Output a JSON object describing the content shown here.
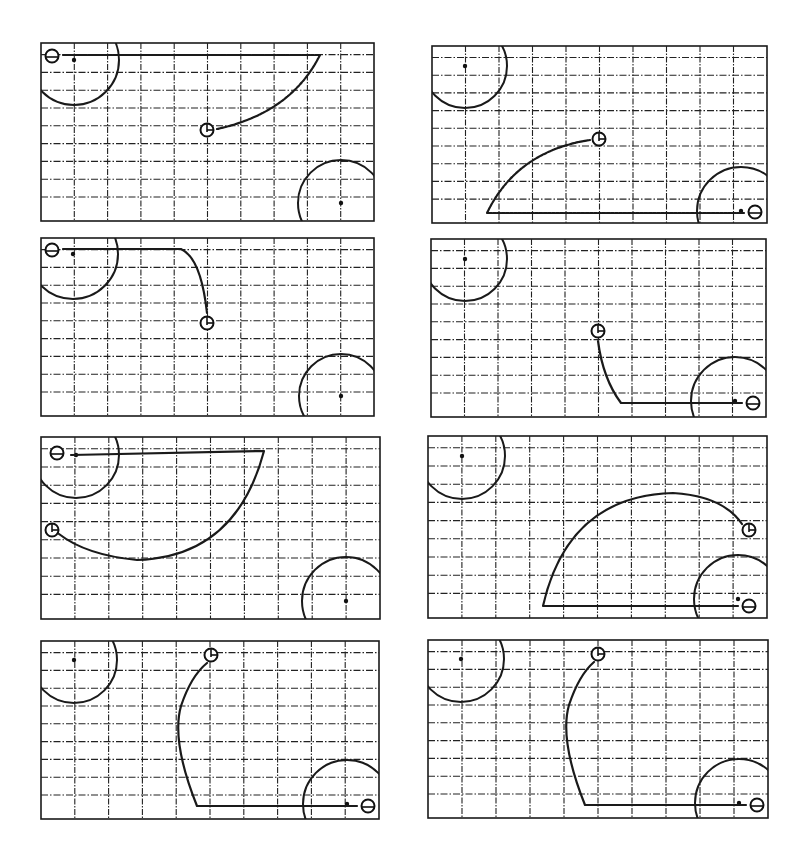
{
  "figure": {
    "layout": {
      "rows": 4,
      "cols": 2
    },
    "grid": {
      "columns": 10,
      "rows": 10
    },
    "colors": {
      "ink": "#1a1a1a",
      "background": "#ffffff"
    },
    "legend_symbols": {
      "start_marker": "circle-with-bar",
      "goal_marker": "circle-with-tick",
      "obstacle": "large-circle",
      "obstacle_center": "dot"
    }
  },
  "chart_data": {
    "type": "diagram",
    "title": "",
    "panels": [
      {
        "id": 1,
        "position": "row1-left",
        "x": 41,
        "y": 43,
        "w": 333,
        "h": 178,
        "obstacles": [
          {
            "cx": 33,
            "cy": 17,
            "r": 45
          },
          {
            "cx": 300,
            "cy": 160,
            "r": 43
          }
        ],
        "start": {
          "x": 11,
          "y": 13,
          "type": "bar"
        },
        "goal": {
          "x": 166,
          "y": 87,
          "type": "tick"
        },
        "path": "M 22 12 L 279 12 Q 250 70 176 86",
        "path_style": "solid-then-dotted"
      },
      {
        "id": 2,
        "position": "row1-right",
        "x": 432,
        "y": 46,
        "w": 335,
        "h": 177,
        "obstacles": [
          {
            "cx": 33,
            "cy": 20,
            "r": 42
          },
          {
            "cx": 309,
            "cy": 165,
            "r": 44
          }
        ],
        "start": {
          "x": 323,
          "y": 166,
          "type": "bar"
        },
        "goal": {
          "x": 167,
          "y": 93,
          "type": "tick"
        },
        "path": "M 312 167 L 55 167 Q 85 105 158 94",
        "path_style": "solid-then-dotted"
      },
      {
        "id": 3,
        "position": "row2-left",
        "x": 41,
        "y": 238,
        "w": 333,
        "h": 178,
        "obstacles": [
          {
            "cx": 32,
            "cy": 16,
            "r": 45
          },
          {
            "cx": 300,
            "cy": 158,
            "r": 42
          }
        ],
        "start": {
          "x": 11,
          "y": 12,
          "type": "bar"
        },
        "goal": {
          "x": 166,
          "y": 85,
          "type": "tick"
        },
        "path": "M 22 11 L 140 11 Q 160 20 166 75",
        "path_style": "solid"
      },
      {
        "id": 4,
        "position": "row2-right",
        "x": 431,
        "y": 239,
        "w": 335,
        "h": 178,
        "obstacles": [
          {
            "cx": 34,
            "cy": 20,
            "r": 42
          },
          {
            "cx": 304,
            "cy": 162,
            "r": 44
          }
        ],
        "start": {
          "x": 322,
          "y": 164,
          "type": "bar"
        },
        "goal": {
          "x": 167,
          "y": 92,
          "type": "tick"
        },
        "path": "M 311 164 L 190 164 Q 172 140 167 102",
        "path_style": "solid"
      },
      {
        "id": 5,
        "position": "row3-left",
        "x": 41,
        "y": 437,
        "w": 339,
        "h": 182,
        "obstacles": [
          {
            "cx": 35,
            "cy": 18,
            "r": 43
          },
          {
            "cx": 305,
            "cy": 164,
            "r": 44
          }
        ],
        "start": {
          "x": 16,
          "y": 16,
          "type": "bar"
        },
        "goal": {
          "x": 11,
          "y": 93,
          "type": "tick"
        },
        "path": "M 30 18 L 223 14 Q 195 120 96 123 Q 45 118 18 97",
        "path_style": "solid"
      },
      {
        "id": 6,
        "position": "row3-right",
        "x": 428,
        "y": 436,
        "w": 339,
        "h": 182,
        "obstacles": [
          {
            "cx": 34,
            "cy": 20,
            "r": 43
          },
          {
            "cx": 310,
            "cy": 163,
            "r": 44
          }
        ],
        "start": {
          "x": 321,
          "y": 170,
          "type": "bar"
        },
        "goal": {
          "x": 321,
          "y": 94,
          "type": "tick"
        },
        "path": "M 310 170 L 115 170 Q 140 60 245 57 Q 295 60 314 88",
        "path_style": "solid"
      },
      {
        "id": 7,
        "position": "row4-left",
        "x": 41,
        "y": 641,
        "w": 338,
        "h": 178,
        "obstacles": [
          {
            "cx": 33,
            "cy": 19,
            "r": 43
          },
          {
            "cx": 306,
            "cy": 163,
            "r": 44
          }
        ],
        "start": {
          "x": 327,
          "y": 165,
          "type": "bar"
        },
        "goal": {
          "x": 170,
          "y": 14,
          "type": "tick"
        },
        "path": "M 316 165 L 156 165 Q 130 100 140 65 Q 150 35 166 22",
        "path_style": "solid"
      },
      {
        "id": 8,
        "position": "row4-right",
        "x": 428,
        "y": 640,
        "w": 340,
        "h": 178,
        "obstacles": [
          {
            "cx": 33,
            "cy": 19,
            "r": 43
          },
          {
            "cx": 311,
            "cy": 163,
            "r": 44
          }
        ],
        "start": {
          "x": 329,
          "y": 165,
          "type": "bar"
        },
        "goal": {
          "x": 170,
          "y": 14,
          "type": "tick"
        },
        "path": "M 318 165 L 157 165 Q 131 100 141 65 Q 151 35 166 22",
        "path_style": "solid"
      }
    ]
  }
}
